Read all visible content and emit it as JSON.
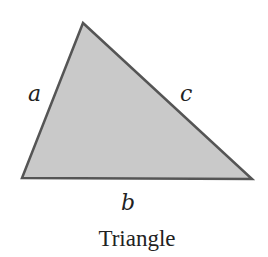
{
  "diagram": {
    "shape": "triangle",
    "vertices": {
      "top": [
        83,
        23
      ],
      "bottom_left": [
        22,
        178
      ],
      "bottom_right": [
        252,
        179
      ]
    },
    "fill_color": "#c9c9c9",
    "stroke_color": "#555555",
    "stroke_width": 2.5,
    "side_labels": {
      "a": {
        "text": "a",
        "x": 28,
        "y": 101
      },
      "b": {
        "text": "b",
        "x": 121,
        "y": 210
      },
      "c": {
        "text": "c",
        "x": 180,
        "y": 101
      }
    },
    "caption": {
      "text": "Triangle",
      "x": 137,
      "y": 246
    }
  }
}
